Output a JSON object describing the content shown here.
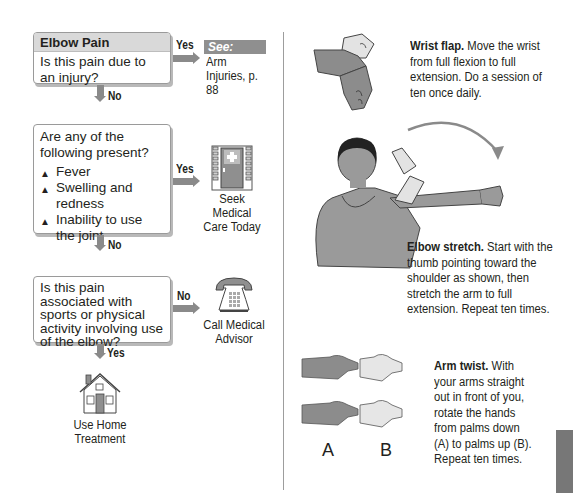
{
  "flowchart": {
    "title": "Elbow Pain",
    "q1": {
      "question": "Is this pain due to an injury?",
      "yes_label": "Yes",
      "no_label": "No",
      "yes_outcome": {
        "tag": "See:",
        "reference": "Arm Injuries, p. 88"
      }
    },
    "q2": {
      "question": "Are any of the following present?",
      "items": [
        "Fever",
        "Swelling and redness",
        "Inability to use the joint"
      ],
      "bullet_glyph": "▲",
      "yes_label": "Yes",
      "no_label": "No",
      "yes_outcome": {
        "label": "Seek Medical Care Today",
        "icon": "clinic-door-icon"
      }
    },
    "q3": {
      "question": "Is this pain associated with sports or physical activity involving use of the elbow?",
      "no_label": "No",
      "yes_label": "Yes",
      "no_outcome": {
        "label": "Call Medical Advisor",
        "icon": "telephone-icon"
      },
      "yes_outcome": {
        "label": "Use Home Treatment",
        "icon": "house-icon"
      }
    }
  },
  "exercises": [
    {
      "name": "Wrist flap.",
      "text": "Move the wrist from full flexion to full extension. Do a session of ten once daily.",
      "illustration": "wrist-flap-illustration"
    },
    {
      "name": "Elbow stretch.",
      "text": "Start with the thumb pointing toward the shoulder as shown, then stretch the arm to full extension. Repeat ten times.",
      "illustration": "elbow-stretch-illustration"
    },
    {
      "name": "Arm twist.",
      "text": "With your arms straight out in front of you, rotate the hands from palms down (A) to palms up (B). Repeat ten times.",
      "illustration": "arm-twist-illustration",
      "labels": [
        "A",
        "B"
      ]
    }
  ],
  "colors": {
    "connector": "#8a8a8a",
    "header_fill": "#d9d9d9",
    "dark_skin": "#8c8c8c",
    "light_skin": "#e6e6e6",
    "thumb_tab": "#777777"
  }
}
